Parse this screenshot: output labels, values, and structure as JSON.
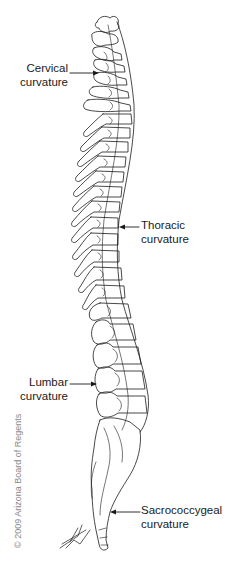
{
  "figure": {
    "labels": [
      {
        "id": "cervical",
        "line1": "Cervical",
        "line2": "curvature",
        "arrow_direction": "right"
      },
      {
        "id": "thoracic",
        "line1": "Thoracic",
        "line2": "curvature",
        "arrow_direction": "left"
      },
      {
        "id": "lumbar",
        "line1": "Lumbar",
        "line2": "curvature",
        "arrow_direction": "right"
      },
      {
        "id": "sacrococcygeal",
        "line1": "Sacrococcygeal",
        "line2": "curvature",
        "arrow_direction": "left"
      }
    ],
    "copyright": "© 2009 Arizona Board of Regents",
    "colors": {
      "line": "#1a1a1a",
      "background": "#ffffff",
      "copyright": "#8a8a8a"
    }
  }
}
